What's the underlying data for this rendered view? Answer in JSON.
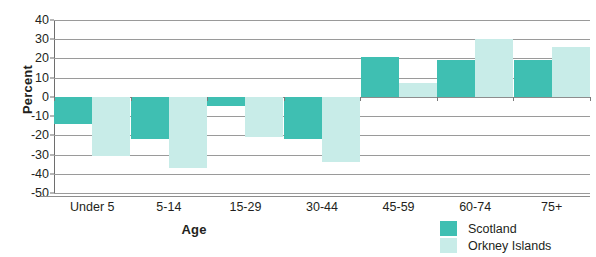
{
  "chart_data": {
    "type": "bar",
    "title": "",
    "subtitle": "",
    "xlabel": "Age",
    "ylabel": "Percent",
    "categories": [
      "Under 5",
      "5-14",
      "15-29",
      "30-44",
      "45-59",
      "60-74",
      "75+"
    ],
    "series": [
      {
        "name": "Scotland",
        "color": "#3fbfb2",
        "values": [
          -14,
          -22,
          -5,
          -22,
          21,
          19,
          19
        ]
      },
      {
        "name": "Orkney Islands",
        "color": "#c8ece8",
        "values": [
          -31,
          -37,
          -21,
          -34,
          7,
          30,
          26
        ]
      }
    ],
    "ylim": [
      -50,
      40
    ],
    "ytick_step": 10,
    "yticks": [
      40,
      30,
      20,
      10,
      0,
      -10,
      -20,
      -30,
      -40,
      -50
    ],
    "ytick_labels": [
      "40",
      "30",
      "20",
      "10",
      "0",
      "-10",
      "-20",
      "-30",
      "-40",
      "-50"
    ],
    "grid": true,
    "grid_axis": "y",
    "legend_position": "bottom-right",
    "orientation": "vertical",
    "bar_group_gap": true
  },
  "legend": {
    "entries": [
      {
        "label": "Scotland",
        "color": "#3fbfb2"
      },
      {
        "label": "Orkney Islands",
        "color": "#c8ece8"
      }
    ]
  },
  "axes": {
    "x_title": "Age",
    "y_title": "Percent"
  },
  "colors": {
    "scotland": "#3fbfb2",
    "orkney": "#c8ece8",
    "gridline": "#9a9a9a",
    "axis": "#6e6e6e",
    "text": "#231f20",
    "background": "#ffffff"
  }
}
